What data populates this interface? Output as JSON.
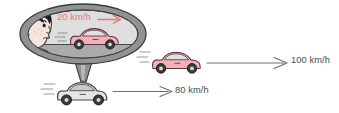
{
  "figure": {
    "name": "rear-view-mirror-relative-speed-diagram",
    "background_color": "#ffffff"
  },
  "labels": {
    "mirror_speed": "20 km/h",
    "own_car_speed": "80 km/h",
    "other_car_speed": "100 km/h"
  },
  "colors": {
    "mirror_speed_text": "#e8767a",
    "speed_text": "#4a4a4a",
    "mirror_frame": "#8c8c8c",
    "mirror_interior_upper": "#d8d8d8",
    "mirror_interior_lower": "#b4b4b4",
    "pink_car_body": "#f6b9c2",
    "pink_car_outline": "#5a3a3f",
    "white_car_body": "#e3e5e6",
    "white_car_outline": "#4a4a4a",
    "outline": "#3c3c3c",
    "hair": "#1c1c1c",
    "skin": "#f2e3dc",
    "arrow_red": "#e8767a",
    "arrow_gray": "#6e6e6e"
  },
  "elements": {
    "mirror": "rear-view mirror oval showing reflected pink car",
    "boy": "boy's head looking into mirror",
    "mirror_car": "pink car reflected in mirror",
    "outside_car": "pink car on road ahead",
    "own_car": "white car carrying the mirror"
  }
}
